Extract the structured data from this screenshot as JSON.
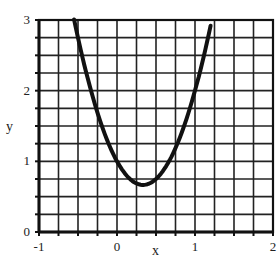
{
  "chart_data": {
    "type": "line",
    "title": "",
    "xlabel": "x",
    "ylabel": "y",
    "xlim": [
      -1,
      2
    ],
    "ylim": [
      0,
      3
    ],
    "x_ticks": [
      "-1",
      "0",
      "1",
      "2"
    ],
    "y_ticks": [
      "0",
      "1",
      "2",
      "3"
    ],
    "grid": true,
    "grid_step": 0.25,
    "legend": "none",
    "series": [
      {
        "name": "y = 3x^2 - 2x + 1",
        "x": [
          -0.55,
          -0.4,
          -0.2,
          0,
          0.2,
          0.333,
          0.5,
          0.7,
          0.9,
          1.05,
          1.2
        ],
        "y": [
          2.01,
          2.28,
          1.52,
          1.0,
          0.72,
          0.667,
          0.75,
          1.07,
          1.63,
          2.21,
          2.92
        ]
      }
    ]
  }
}
